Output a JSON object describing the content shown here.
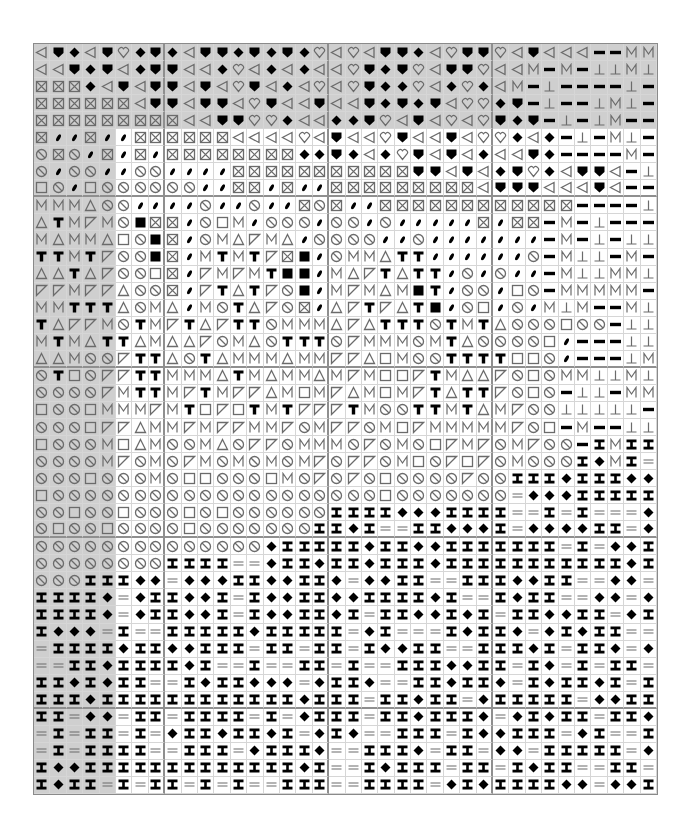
{
  "chart": {
    "columns": 38,
    "rows": 44,
    "major_every": 10,
    "first_major_col": 8,
    "first_major_row": 9,
    "legend": {
      "L": "outline-left-triangle",
      "S": "filled-shield",
      "D": "filled-diamond",
      "H": "outline-heart",
      "X": "boxed-x",
      "B": "filled-teardrop",
      "O": "slashed-circle",
      "Q": "outline-square",
      "M": "letter-m",
      "A": "outline-triangle",
      "T": "bold-t",
      "P": "corner-triangle",
      "K": "filled-square",
      "E": "thick-dash",
      "U": "up-tack",
      "I": "i-beam",
      "W": "double-line"
    },
    "colors": {
      "shade": "#cfcfcf",
      "grid_minor": "#d6d6d6",
      "grid_major": "#8f8f8f",
      "outline_symbol": "#6b6b6b",
      "filled_symbol": "#000000"
    },
    "shade_rows_full": 5,
    "shade_cols_left": 5,
    "grid": [
      "LSDLSHDSDLSSDSDSDHLHLSSDLHSSHLSLLLEEMM",
      "LLSDSLDSSLLDHLDLDLLHSDSHLSSHLLMEMEUUMU",
      "XXXDLSLSSLSLHSLDLHLHSDDHLDHDLMEUEEEEUE",
      "XXXXXXLSSLSSLHSLLSLLSDSDSLHHDSEUEEUMUE",
      "XXXXXXXXXLLSSHHDLLDDSHLSLHLHSDSEUEUMEE",
      "XBBXBBXXXXXXLLLLHLSLLHSLLSLHHDLDEUEMUE",
      "OXOBXBXBXXXXXXXXDDSDLDHSLSLDLLSDEEEEME",
      "OBOOBBOOBBBBXXXXXXXXXXXSSLSLDSHDLSSLEU",
      "QOBQOOOOOOBBXXBXBBXXXXXXXXXLSSSLLLSLEE",
      "MMMAOOBBBBOBBOBBXOXBBXXXXXXXXXXXXEEEEU",
      "ATMPMOKXXBOQMBOOOBOOBOBBBBBXBXXEMEUEEE",
      "MAMMAQOKXBOMAPMABOOOOBBOBBBBBBBEMEUEUU",
      "TTMTPOOKXBMTMTPXKBOMMATTBBBBBBOEMUUEME",
      "AATAPOOQXBPMPMTKKBMAPTATTBOBOBBEMUUMMU",
      "PPMPPAOOXBPTATPOKBMPMAMKTBOOBQOEMMMMME",
      "MMTTTAOMABMOTAPOXBAPTPATKBOQBOBMUMEEMU",
      "TAPPMOTMPTAPTTOMMMAPATTTOTMTAOOOQOOEUU",
      "MTMATTAMAAPOMAOTTTOPMMMOMTAOOOOQBEEEUU",
      "AAMOOPTTAOTAMMMAMMPPAQMOOTTTTQQOBEEEUM",
      "OTQOPPTTMMMATMAMMAMPMQQPTMAAPOQOMMUUMU",
      "OOOOPMTTMPTMPPAMQMPAMQMPTATTPOQOEUUEMM",
      "QOOQMMMPMTQPQTMTPPPTMOOTTMTAMPOOUUUUUE",
      "OOOQPPAMMPMPPMMPOMPPOMQPMMMMMPOQEMEEUU",
      "QOOOMQAMOOMAOPPOMMMOPOMOQPMPOMPOOEIMII",
      "OOOOMPOMOPMOMOMOMPOPPOMQOPQPOMOOOIDMIW",
      "OOOQOOOMOQQOOOQMOPOPOQOOOOPOOIIIDIIIDD",
      "QOOOOOOOOOOOOOOOOOOOOQOOOOOOOWDDDIIIII",
      "OOQOOQOOOQOQOOOOOOIIIIDDDIIIIWWIWIWWWD",
      "OQOOQOOOOQOOOOOOOIIDIWWIIDDDIWDDDDIIWD",
      "OOOOOOOOOOOOOODIIIIIDIIDDIIIIIIIWIWDDI",
      "OOOOOOOOIIIIWWDIIDIIDIIIDIIIIIIIIIIIDI",
      "OOOIIIDDWDDDIIDDIIDWDDIIWWIIIDDIIWWDDW",
      "IIIIDWDIIDDIWIDDIIDDIIIIDIWWIDIIWWDDWD",
      "IIIIDWDIIDDIWIDDIIDIWIIDDIDIWIIDDIIWDI",
      "IDDDWIWWIIIIIDIIIIIWDIWWWIDIIDWDIDIIWW",
      "WIIIIDIIDDIIIWIIWIIWIDDIIWWIIIDIWIIDWD",
      "WWIIDIIIIDIWWIWWIIWIWWIIIDDIIWIDWIWIIW",
      "IIDIDIIWWIDIIDDDWDIIDWWIIDIIDWIDIIDIWI",
      "IIIDIIIIIIIIIIIIDIIIWIIDIIWDIIIIIWDDII",
      "IIWDDWIIWIIIIWIWDIIIWIIDIIIDWDIDIIWIID",
      "WIWIIWIWDIIDIIDIWDIDWWIIIWIDDIIIWDIWWI",
      "WIWIIIIWWIIIWDIIIDWWIIIDWIIWDDWIIIIIWD",
      "IDDIIIIIIIIIIIIIDIWWIDIIIWIIWIDIIWWIIW",
      "IDIIWIWIIWIWIWWIIIWWIIIIWDIDIIIIDDWDDI"
    ]
  }
}
